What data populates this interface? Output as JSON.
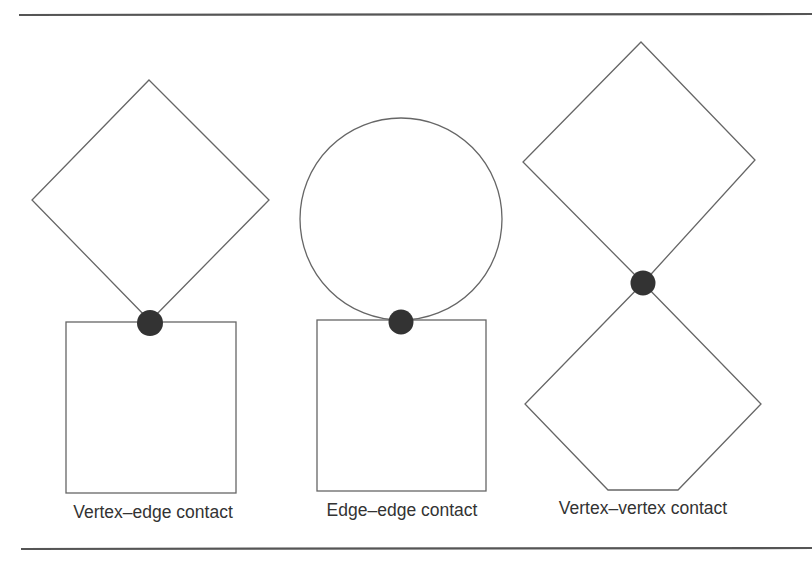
{
  "figure": {
    "background": "#ffffff",
    "rule_color": "#555555",
    "stroke_color": "#666666",
    "contact_color": "#333333",
    "text_color": "#333333",
    "rules": {
      "top": {
        "x1": 19,
        "y1": 15,
        "x2": 812,
        "y2": 14
      },
      "bottom": {
        "x1": 21,
        "y1": 549,
        "x2": 812,
        "y2": 548
      }
    },
    "panels": [
      {
        "id": "vertex-edge",
        "label": "Vertex–edge contact",
        "label_x": 153,
        "label_y": 518,
        "upper_shape": {
          "type": "diamond",
          "points": "149,80 269,200 150,321 32,200"
        },
        "lower_shape": {
          "type": "square",
          "x": 66,
          "y": 322,
          "width": 170,
          "height": 171
        },
        "contact": {
          "cx": 150,
          "cy": 323,
          "r": 13
        }
      },
      {
        "id": "edge-edge",
        "label": "Edge–edge contact",
        "label_x": 402,
        "label_y": 516,
        "upper_shape": {
          "type": "circle",
          "cx": 401,
          "cy": 219,
          "r": 101
        },
        "lower_shape": {
          "type": "square",
          "x": 317,
          "y": 320,
          "width": 169,
          "height": 171
        },
        "contact": {
          "cx": 401,
          "cy": 322,
          "r": 12.5
        }
      },
      {
        "id": "vertex-vertex",
        "label": "Vertex–vertex contact",
        "label_x": 643,
        "label_y": 514,
        "upper_shape": {
          "type": "diamond",
          "points": "641,42 755,160 643,283 523,162"
        },
        "lower_shape": {
          "type": "pentagon",
          "points": "643,283 761,404 678,490 608,490 525,404"
        },
        "contact": {
          "cx": 643,
          "cy": 283,
          "r": 12.5
        }
      }
    ]
  }
}
